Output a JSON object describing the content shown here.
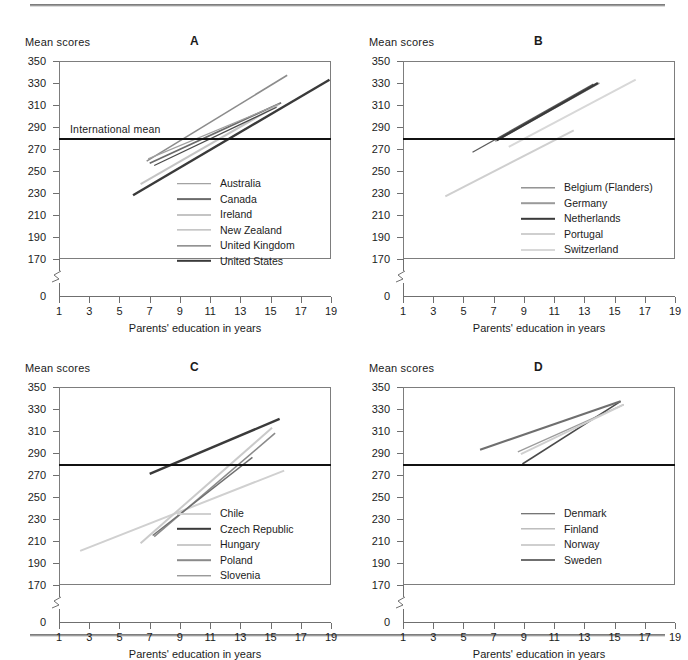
{
  "figure": {
    "y_axis_title": "Mean scores",
    "x_axis_title": "Parents' education in years",
    "international_mean_label": "International mean",
    "international_mean_value": 279,
    "y_ticks": [
      350,
      330,
      310,
      290,
      270,
      250,
      230,
      210,
      190,
      170
    ],
    "y_zero_tick": "0",
    "x_ticks": [
      1,
      3,
      5,
      7,
      9,
      11,
      13,
      15,
      17,
      19
    ],
    "ylim": [
      170,
      350
    ],
    "xlim": [
      1,
      19
    ]
  },
  "chart_data": [
    {
      "type": "line",
      "panel": "A",
      "title": "A",
      "xlabel": "Parents' education in years",
      "ylabel": "Mean scores",
      "xlim": [
        1,
        19
      ],
      "ylim": [
        170,
        350
      ],
      "grid": false,
      "legend_position": "inside-lower-right",
      "annotations": [
        {
          "text": "International mean",
          "value": 279
        }
      ],
      "series": [
        {
          "name": "Australia",
          "color": "#8c8c8c",
          "width": 1.6,
          "x": [
            6.8,
            16.1
          ],
          "y": [
            259,
            337
          ]
        },
        {
          "name": "Canada",
          "color": "#6b6b6b",
          "width": 1.8,
          "x": [
            7.0,
            15.7
          ],
          "y": [
            257,
            312
          ]
        },
        {
          "name": "Ireland",
          "color": "#c4c4c4",
          "width": 2.0,
          "x": [
            6.4,
            15.5
          ],
          "y": [
            238,
            310
          ]
        },
        {
          "name": "New Zealand",
          "color": "#a0a0a0",
          "width": 1.2,
          "x": [
            6.9,
            15.6
          ],
          "y": [
            261,
            311
          ]
        },
        {
          "name": "United Kingdom",
          "color": "#4a4a4a",
          "width": 1.2,
          "x": [
            7.3,
            15.4
          ],
          "y": [
            255,
            308
          ]
        },
        {
          "name": "United States",
          "color": "#3a3a3a",
          "width": 2.4,
          "x": [
            5.9,
            18.9
          ],
          "y": [
            228,
            333
          ]
        }
      ]
    },
    {
      "type": "line",
      "panel": "B",
      "title": "B",
      "xlabel": "Parents' education in years",
      "ylabel": "Mean scores",
      "xlim": [
        1,
        19
      ],
      "ylim": [
        170,
        350
      ],
      "grid": false,
      "legend_position": "inside-lower-right",
      "annotations": [
        {
          "text": "International mean",
          "value": 279
        }
      ],
      "series": [
        {
          "name": "Belgium (Flanders)",
          "color": "#5c5c5c",
          "width": 1.3,
          "x": [
            5.6,
            13.6
          ],
          "y": [
            267,
            329
          ]
        },
        {
          "name": "Germany",
          "color": "#9a9a9a",
          "width": 1.6,
          "x": [
            7.1,
            14.0
          ],
          "y": [
            277,
            330
          ]
        },
        {
          "name": "Netherlands",
          "color": "#3a3a3a",
          "width": 2.4,
          "x": [
            7.2,
            13.9
          ],
          "y": [
            278,
            330
          ]
        },
        {
          "name": "Portugal",
          "color": "#cfcfcf",
          "width": 2.0,
          "x": [
            3.8,
            12.3
          ],
          "y": [
            227,
            287
          ]
        },
        {
          "name": "Switzerland",
          "color": "#d8d8d8",
          "width": 2.0,
          "x": [
            8.0,
            16.4
          ],
          "y": [
            272,
            333
          ]
        }
      ]
    },
    {
      "type": "line",
      "panel": "C",
      "title": "C",
      "xlabel": "Parents' education in years",
      "ylabel": "Mean scores",
      "xlim": [
        1,
        19
      ],
      "ylim": [
        170,
        350
      ],
      "grid": false,
      "legend_position": "inside-lower-right",
      "annotations": [
        {
          "text": "International mean",
          "value": 279
        }
      ],
      "series": [
        {
          "name": "Chile",
          "color": "#d0d0d0",
          "width": 2.0,
          "x": [
            2.4,
            15.9
          ],
          "y": [
            201,
            274
          ]
        },
        {
          "name": "Czech Republic",
          "color": "#3a3a3a",
          "width": 2.4,
          "x": [
            7.0,
            15.6
          ],
          "y": [
            271,
            321
          ]
        },
        {
          "name": "Hungary",
          "color": "#cacaca",
          "width": 2.0,
          "x": [
            6.4,
            15.1
          ],
          "y": [
            208,
            313
          ]
        },
        {
          "name": "Poland",
          "color": "#8a8a8a",
          "width": 1.6,
          "x": [
            7.3,
            15.3
          ],
          "y": [
            214,
            308
          ]
        },
        {
          "name": "Slovenia",
          "color": "#6f6f6f",
          "width": 1.4,
          "x": [
            7.2,
            13.8
          ],
          "y": [
            215,
            286
          ]
        }
      ]
    },
    {
      "type": "line",
      "panel": "D",
      "title": "D",
      "xlabel": "Parents' education in years",
      "ylabel": "Mean scores",
      "xlim": [
        1,
        19
      ],
      "ylim": [
        170,
        350
      ],
      "grid": false,
      "legend_position": "inside-lower-right",
      "annotations": [
        {
          "text": "International mean",
          "value": 279
        }
      ],
      "series": [
        {
          "name": "Denmark",
          "color": "#4a4a4a",
          "width": 1.5,
          "x": [
            8.9,
            15.4
          ],
          "y": [
            280,
            337
          ]
        },
        {
          "name": "Finland",
          "color": "#9c9c9c",
          "width": 1.3,
          "x": [
            8.6,
            15.6
          ],
          "y": [
            291,
            334
          ]
        },
        {
          "name": "Norway",
          "color": "#cfcfcf",
          "width": 2.0,
          "x": [
            8.8,
            15.6
          ],
          "y": [
            289,
            334
          ]
        },
        {
          "name": "Sweden",
          "color": "#6f6f6f",
          "width": 2.0,
          "x": [
            6.1,
            15.4
          ],
          "y": [
            293,
            337
          ]
        }
      ]
    }
  ]
}
